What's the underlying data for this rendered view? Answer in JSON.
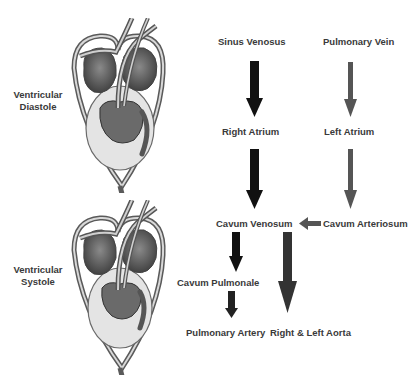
{
  "phases": [
    {
      "label_line1": "Ventricular",
      "label_line2": "Diastole"
    },
    {
      "label_line1": "Ventricular",
      "label_line2": "Systole"
    }
  ],
  "flow": {
    "nodes": {
      "sinus_venosus": "Sinus Venosus",
      "pulmonary_vein": "Pulmonary Vein",
      "right_atrium": "Right Atrium",
      "left_atrium": "Left Atrium",
      "cavum_venosum": "Cavum Venosum",
      "cavum_arteriosum": "Cavum Arteriosum",
      "cavum_pulmonale": "Cavum Pulmonale",
      "pulmonary_artery": "Pulmonary Artery",
      "aorta": "Right & Left Aorta"
    },
    "edges": [
      {
        "from": "Sinus Venosus",
        "to": "Right Atrium",
        "color": "#111111"
      },
      {
        "from": "Pulmonary Vein",
        "to": "Left Atrium",
        "color": "#555555"
      },
      {
        "from": "Right Atrium",
        "to": "Cavum Venosum",
        "color": "#111111"
      },
      {
        "from": "Left Atrium",
        "to": "Cavum Arteriosum",
        "color": "#555555"
      },
      {
        "from": "Cavum Arteriosum",
        "to": "Cavum Venosum",
        "color": "#555555"
      },
      {
        "from": "Cavum Venosum",
        "to": "Cavum Pulmonale",
        "color": "#111111"
      },
      {
        "from": "Cavum Pulmonale",
        "to": "Pulmonary Artery",
        "color": "#222222"
      },
      {
        "from": "Cavum Venosum",
        "to": "Right & Left Aorta",
        "color": "#333333"
      }
    ]
  },
  "colors": {
    "deoxygenated_arrow": "#111111",
    "oxygenated_arrow": "#555555",
    "label_text": "#3a3a3a"
  }
}
